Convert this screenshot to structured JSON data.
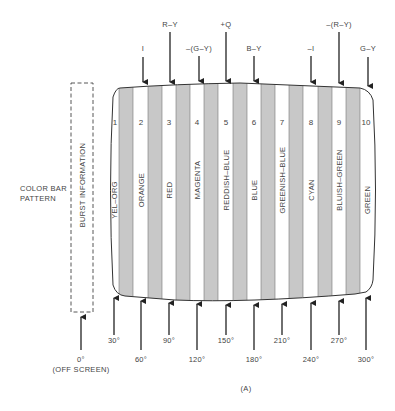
{
  "figure": {
    "caption": "(A)",
    "side_label": [
      "COLOR BAR",
      "PATTERN"
    ],
    "burst_label": "BURST INFORMATION",
    "colors": {
      "gray_bar": "#c8c8c8",
      "line": "#333333",
      "text": "#444444"
    }
  },
  "bars": [
    {
      "num": "1",
      "name": "YEL–ORG"
    },
    {
      "num": "2",
      "name": "ORANGE"
    },
    {
      "num": "3",
      "name": "RED"
    },
    {
      "num": "4",
      "name": "MAGENTA"
    },
    {
      "num": "5",
      "name": "REDDISH–BLUE"
    },
    {
      "num": "6",
      "name": "BLUE"
    },
    {
      "num": "7",
      "name": "GREENISH–BLUE"
    },
    {
      "num": "8",
      "name": "CYAN"
    },
    {
      "num": "9",
      "name": "BLUISH–GREEN"
    },
    {
      "num": "10",
      "name": "GREEN"
    }
  ],
  "top_signals": [
    {
      "label": "I",
      "bar": 2
    },
    {
      "label": "R–Y",
      "bar": 3
    },
    {
      "label": "–(G–Y)",
      "bar": 4
    },
    {
      "label": "+Q",
      "bar": 5
    },
    {
      "label": "B–Y",
      "bar": 6
    },
    {
      "label": "–I",
      "bar": 8
    },
    {
      "label": "–(R–Y)",
      "bar": 9
    },
    {
      "label": "G–Y",
      "bar": 10
    }
  ],
  "phase_angles": [
    {
      "label": "0°",
      "sub": "(OFF SCREEN)"
    },
    {
      "label": "30°"
    },
    {
      "label": "60°"
    },
    {
      "label": "90°"
    },
    {
      "label": "120°"
    },
    {
      "label": "150°"
    },
    {
      "label": "180°"
    },
    {
      "label": "210°"
    },
    {
      "label": "240°"
    },
    {
      "label": "270°"
    },
    {
      "label": "300°"
    }
  ]
}
